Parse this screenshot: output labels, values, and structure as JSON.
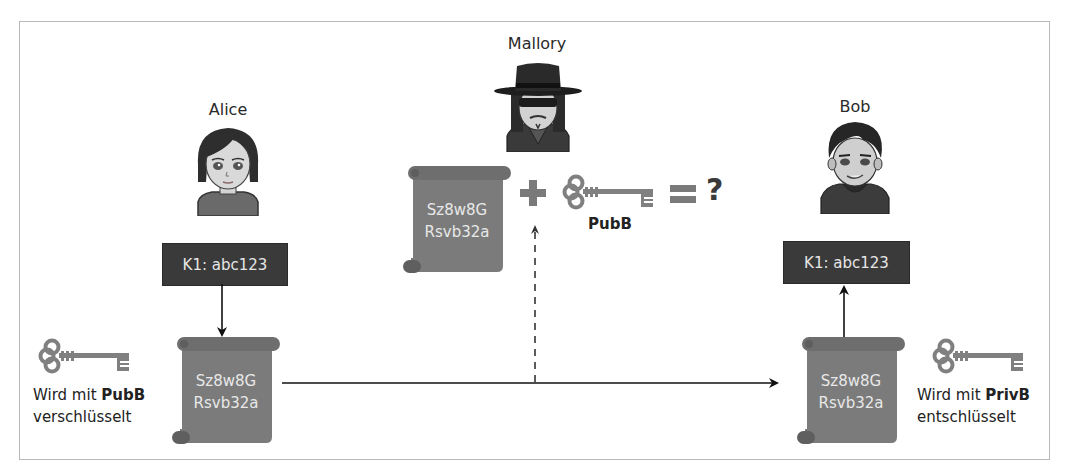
{
  "diagram": {
    "title": "",
    "colors": {
      "frame_border": "#b9b9b9",
      "key_box_bg": "#3a3a3a",
      "key_box_text": "#e6e6e6",
      "scroll_fill": "#7b7b7b",
      "scroll_text": "#e8e8e8",
      "key_icon": "#808080",
      "arrow": "#111111"
    },
    "alice": {
      "name": "Alice",
      "avatar": "alice-avatar",
      "plaintext_key": "K1: abc123",
      "ciphertext_line1": "Sz8w8G",
      "ciphertext_line2": "Rsvb32a",
      "caption_prefix": "Wird mit ",
      "caption_key": "PubB",
      "caption_suffix": "verschlüsselt",
      "key_icon": "key-icon"
    },
    "mallory": {
      "name": "Mallory",
      "avatar": "mallory-avatar",
      "ciphertext_line1": "Sz8w8G",
      "ciphertext_line2": "Rsvb32a",
      "plus": "+",
      "key_label": "PubB",
      "equals": "=",
      "result": "?"
    },
    "bob": {
      "name": "Bob",
      "avatar": "bob-avatar",
      "plaintext_key": "K1: abc123",
      "ciphertext_line1": "Sz8w8G",
      "ciphertext_line2": "Rsvb32a",
      "caption_prefix": "Wird mit ",
      "caption_key": "PrivB",
      "caption_suffix": "entschlüsselt",
      "key_icon": "key-icon"
    },
    "edges": [
      {
        "from": "alice-k1",
        "to": "alice-scroll",
        "style": "solid"
      },
      {
        "from": "alice-scroll",
        "to": "bob-scroll",
        "style": "solid"
      },
      {
        "from": "transit",
        "to": "mallory-scroll",
        "style": "dashed"
      },
      {
        "from": "bob-scroll",
        "to": "bob-k1",
        "style": "solid"
      }
    ]
  }
}
